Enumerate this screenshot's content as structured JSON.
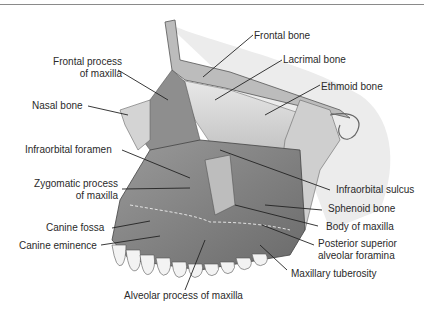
{
  "figure": {
    "labels": {
      "frontal_bone": "Frontal bone",
      "lacrimal_bone": "Lacrimal bone",
      "ethmoid_bone": "Ethmoid bone",
      "frontal_process_1": "Frontal process",
      "frontal_process_2": "of maxilla",
      "nasal_bone": "Nasal bone",
      "infraorbital_foramen": "Infraorbital foramen",
      "zygomatic_process_1": "Zygomatic process",
      "zygomatic_process_2": "of maxilla",
      "infraorbital_sulcus": "Infraorbital sulcus",
      "sphenoid_bone": "Sphenoid bone",
      "body_of_maxilla": "Body of maxilla",
      "canine_fossa": "Canine fossa",
      "canine_eminence": "Canine eminence",
      "posterior_superior_1": "Posterior superior",
      "posterior_superior_2": "alveolar foramina",
      "maxillary_tuberosity": "Maxillary tuberosity",
      "alveolar_process": "Alveolar process of maxilla"
    }
  }
}
